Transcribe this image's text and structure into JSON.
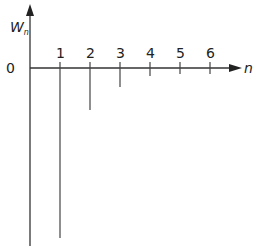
{
  "chart_data": {
    "type": "stem",
    "title": "",
    "xlabel": "n",
    "ylabel": "W_n",
    "ylabel_main": "W",
    "ylabel_sub": "n",
    "origin_label": "0",
    "categories": [
      "1",
      "2",
      "3",
      "4",
      "5",
      "6"
    ],
    "x": [
      1,
      2,
      3,
      4,
      5,
      6
    ],
    "values": [
      -170,
      -42,
      -19,
      -8,
      -4,
      -2
    ],
    "note": "Values are relative stem lengths (downward, negative) read in pixel units; no numeric y ticks shown",
    "grid": false,
    "legend": null
  }
}
